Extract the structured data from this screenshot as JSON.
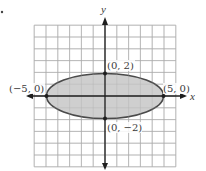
{
  "figure": {
    "type": "ellipse-graph",
    "marker": "•",
    "axes": {
      "x_label": "x",
      "y_label": "y",
      "x_range": [
        -6,
        6
      ],
      "y_range": [
        -6,
        6
      ],
      "grid": true
    },
    "ellipse": {
      "center": [
        0,
        0
      ],
      "semi_major": 5,
      "semi_minor": 2,
      "equation": "x^2/25 + y^2/4 = 1",
      "fill_color": "#cfcfcf",
      "stroke_color": "#4a4a4a"
    },
    "points": [
      {
        "label": "(0, 2)",
        "x": 0,
        "y": 2
      },
      {
        "label": "(0, −2)",
        "x": 0,
        "y": -2
      },
      {
        "label": "(−5, 0)",
        "x": -5,
        "y": 0
      },
      {
        "label": "(5, 0)",
        "x": 5,
        "y": 0
      }
    ],
    "colors": {
      "grid": "#b0b0b0",
      "axis": "#1e1e1e",
      "background": "#ffffff"
    }
  }
}
